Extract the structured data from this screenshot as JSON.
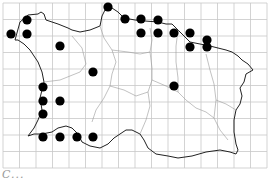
{
  "map": {
    "title": "Distribution map",
    "grid": {
      "x0": 3,
      "y0": 3,
      "cell": 16.5,
      "cols": 16,
      "rows": 10,
      "color": "#c8c8c8"
    },
    "coast_color": "#222222",
    "parish_color": "#999999",
    "dot_color": "#000000",
    "dot_radius": 4.6,
    "dots": [
      [
        11,
        34
      ],
      [
        27,
        20
      ],
      [
        27,
        34
      ],
      [
        60,
        46
      ],
      [
        93,
        72
      ],
      [
        43,
        87
      ],
      [
        43,
        101
      ],
      [
        60,
        101
      ],
      [
        43,
        114
      ],
      [
        43,
        137
      ],
      [
        60,
        137
      ],
      [
        77,
        137
      ],
      [
        93,
        137
      ],
      [
        108,
        7
      ],
      [
        125,
        19
      ],
      [
        141,
        19
      ],
      [
        158,
        20
      ],
      [
        141,
        33
      ],
      [
        158,
        33
      ],
      [
        174,
        33
      ],
      [
        190,
        33
      ],
      [
        190,
        47
      ],
      [
        207,
        47
      ],
      [
        207,
        40
      ],
      [
        174,
        86
      ]
    ]
  },
  "caption": {
    "text": "C..."
  }
}
